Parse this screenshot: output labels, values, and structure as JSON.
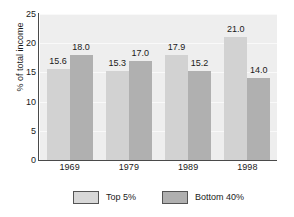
{
  "chart_data": {
    "type": "bar",
    "title": "",
    "subtitle": "",
    "xlabel": "",
    "ylabel": "% of total income",
    "categories": [
      "1969",
      "1979",
      "1989",
      "1998"
    ],
    "series": [
      {
        "name": "Top 5%",
        "values": [
          15.6,
          15.3,
          17.9,
          21.0
        ],
        "color": "#d2d2d2"
      },
      {
        "name": "Bottom 40%",
        "values": [
          18.0,
          17.0,
          15.2,
          14.0
        ],
        "color": "#b0b0b0"
      }
    ],
    "value_labels": [
      [
        "15.6",
        "15.3",
        "17.9",
        "21.0"
      ],
      [
        "18.0",
        "17.0",
        "15.2",
        "14.0"
      ]
    ],
    "ylim": [
      0,
      25
    ],
    "yticks": [
      0,
      5,
      10,
      15,
      20,
      25
    ],
    "ytick_labels": [
      "0",
      "5",
      "10",
      "15",
      "20",
      "25"
    ],
    "grid": true,
    "grid_axis": "y",
    "legend_position": "bottom",
    "plot_background": "#eeeeee"
  },
  "legend": {
    "entries": [
      {
        "label": "Top 5%"
      },
      {
        "label": "Bottom 40%"
      }
    ]
  },
  "axes": {
    "y_title": "% of total income"
  }
}
